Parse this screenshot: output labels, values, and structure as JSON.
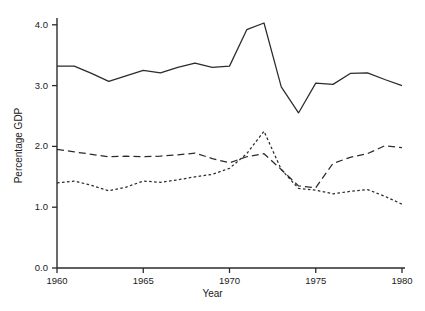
{
  "chart_data": {
    "type": "line",
    "title": "",
    "xlabel": "Year",
    "ylabel": "Percentage GDP",
    "xlim": [
      1960,
      1980
    ],
    "ylim": [
      0.0,
      4.2
    ],
    "xticks": [
      1960,
      1965,
      1970,
      1975,
      1980
    ],
    "xtick_labels": [
      "1960",
      "1965",
      "1970",
      "1975",
      "1980"
    ],
    "yticks": [
      0.0,
      1.0,
      2.0,
      3.0,
      4.0
    ],
    "ytick_labels": [
      "0.0",
      "1.0",
      "2.0",
      "3.0",
      "4.0"
    ],
    "grid": false,
    "legend": "none",
    "line_color": "#2b2b2b",
    "background": "#ffffff",
    "x": [
      1960,
      1961,
      1962,
      1963,
      1964,
      1965,
      1966,
      1967,
      1968,
      1969,
      1970,
      1971,
      1972,
      1973,
      1974,
      1975,
      1976,
      1977,
      1978,
      1979,
      1980
    ],
    "series": [
      {
        "name": "solid",
        "style": "solid",
        "values": [
          3.32,
          3.32,
          3.2,
          3.07,
          3.16,
          3.25,
          3.21,
          3.3,
          3.37,
          3.3,
          3.32,
          3.92,
          4.03,
          2.98,
          2.55,
          3.04,
          3.02,
          3.2,
          3.21,
          3.1,
          3.0
        ]
      },
      {
        "name": "long-dashed",
        "style": "dashed",
        "values": [
          1.95,
          1.91,
          1.87,
          1.83,
          1.84,
          1.83,
          1.84,
          1.86,
          1.89,
          1.8,
          1.73,
          1.83,
          1.88,
          1.62,
          1.35,
          1.32,
          1.72,
          1.82,
          1.88,
          2.01,
          1.98
        ]
      },
      {
        "name": "short-dashed",
        "style": "dotted",
        "values": [
          1.4,
          1.43,
          1.36,
          1.27,
          1.33,
          1.43,
          1.41,
          1.45,
          1.5,
          1.54,
          1.64,
          1.88,
          2.25,
          1.62,
          1.31,
          1.28,
          1.22,
          1.26,
          1.29,
          1.18,
          1.05
        ]
      }
    ]
  },
  "axes": {
    "ylabel": "Percentage GDP",
    "xlabel": "Year"
  }
}
